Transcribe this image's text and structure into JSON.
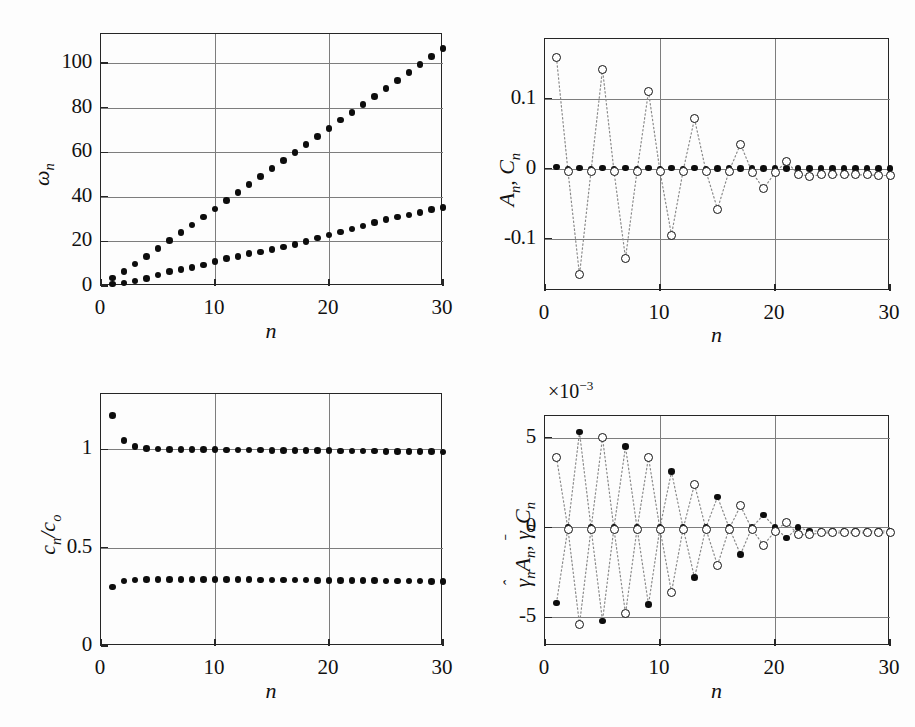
{
  "figure": {
    "panel_count": 4,
    "background": "#ffffff",
    "marker_filled_color": "#0d0d0d",
    "marker_open_color": "#111111",
    "gridline_color": "#7d7d7d",
    "axis_color": "#262626"
  },
  "panels": [
    {
      "id": "panel-omega",
      "position": "top-left",
      "xlabel": "n",
      "ylabel": "ωn",
      "ylabel_parts": {
        "symbol": "ω",
        "subscript": "n"
      },
      "xticks": [
        "0",
        "10",
        "20",
        "30"
      ],
      "yticks": [
        "0",
        "20",
        "40",
        "60",
        "80",
        "100"
      ],
      "xlim": [
        0,
        30
      ],
      "ylim": [
        0,
        113
      ],
      "exponent": ""
    },
    {
      "id": "panel-AnCn",
      "position": "top-right",
      "xlabel": "n",
      "ylabel": "An, Cn",
      "xticks": [
        "0",
        "10",
        "20",
        "30"
      ],
      "yticks": [
        "-0.1",
        "0",
        "0.1"
      ],
      "xlim": [
        0,
        30
      ],
      "ylim": [
        -0.175,
        0.185
      ],
      "exponent": ""
    },
    {
      "id": "panel-cnco",
      "position": "bottom-left",
      "xlabel": "n",
      "ylabel": "cn/co",
      "xticks": [
        "0",
        "10",
        "20",
        "30"
      ],
      "yticks": [
        "0",
        "0.5",
        "1"
      ],
      "xlim": [
        0,
        30
      ],
      "ylim": [
        0,
        1.28
      ],
      "exponent": ""
    },
    {
      "id": "panel-gammaAC",
      "position": "bottom-right",
      "xlabel": "n",
      "ylabel": "γ̂n An, γ̄n Cn",
      "xticks": [
        "0",
        "10",
        "20",
        "30"
      ],
      "yticks": [
        "-5",
        "0",
        "5"
      ],
      "xlim": [
        0,
        30
      ],
      "ylim": [
        -6.6,
        6.2
      ],
      "exponent": "×10⁻³"
    }
  ],
  "chart_data": [
    {
      "type": "scatter",
      "id": "panel-omega",
      "title": "",
      "xlabel": "n",
      "ylabel": "ωn",
      "xlim": [
        0,
        30
      ],
      "ylim": [
        0,
        113
      ],
      "grid": true,
      "legend": "none",
      "x": [
        1,
        2,
        3,
        4,
        5,
        6,
        7,
        8,
        9,
        10,
        11,
        12,
        13,
        14,
        15,
        16,
        17,
        18,
        19,
        20,
        21,
        22,
        23,
        24,
        25,
        26,
        27,
        28,
        29,
        30
      ],
      "series": [
        {
          "name": "branch-upper",
          "marker": "filled-circle",
          "values": [
            3.5,
            6.6,
            9.8,
            13.3,
            16.8,
            20.3,
            23.9,
            27.4,
            31.0,
            34.6,
            38.3,
            41.8,
            45.4,
            49.0,
            52.6,
            56.2,
            59.8,
            63.4,
            67.0,
            70.7,
            74.4,
            77.9,
            81.4,
            85.1,
            88.6,
            92.2,
            95.8,
            99.4,
            102.8,
            106.4
          ]
        },
        {
          "name": "branch-lower",
          "marker": "filled-circle",
          "values": [
            0.9,
            1.4,
            2.3,
            3.4,
            4.9,
            6.4,
            7.4,
            8.4,
            9.5,
            11.1,
            12.4,
            13.3,
            14.5,
            15.3,
            16.3,
            17.4,
            18.6,
            20.0,
            21.5,
            22.9,
            24.3,
            25.5,
            26.9,
            28.4,
            29.7,
            30.9,
            31.9,
            33.0,
            34.2,
            35.2
          ]
        }
      ]
    },
    {
      "type": "scatter",
      "id": "panel-AnCn",
      "title": "",
      "xlabel": "n",
      "ylabel": "An, Cn",
      "xlim": [
        0,
        30
      ],
      "ylim": [
        -0.175,
        0.185
      ],
      "grid": true,
      "legend": "none",
      "x": [
        1,
        2,
        3,
        4,
        5,
        6,
        7,
        8,
        9,
        10,
        11,
        12,
        13,
        14,
        15,
        16,
        17,
        18,
        19,
        20,
        21,
        22,
        23,
        24,
        25,
        26,
        27,
        28,
        29,
        30
      ],
      "series": [
        {
          "name": "An",
          "marker": "filled-circle",
          "connect": false,
          "values": [
            0.002,
            -0.0015,
            0.001,
            -0.001,
            0.0008,
            -0.0008,
            0.0007,
            -0.0007,
            0.0006,
            -0.0006,
            0.0005,
            -0.0005,
            0.0005,
            -0.0005,
            0.0004,
            -0.0004,
            0.0004,
            -0.0004,
            0.0003,
            -0.0003,
            0.0003,
            -0.0003,
            0.0003,
            -0.0003,
            0.0002,
            -0.0002,
            0.0002,
            -0.0002,
            0.0002,
            -0.0002
          ]
        },
        {
          "name": "Cn",
          "marker": "open-circle",
          "connect": true,
          "values": [
            0.158,
            -0.004,
            -0.152,
            -0.004,
            0.142,
            -0.004,
            -0.128,
            -0.004,
            0.11,
            -0.004,
            -0.095,
            -0.004,
            0.071,
            -0.004,
            -0.058,
            -0.004,
            0.035,
            -0.005,
            -0.029,
            -0.006,
            0.01,
            -0.008,
            -0.011,
            -0.009,
            -0.009,
            -0.009,
            -0.009,
            -0.009,
            -0.01,
            -0.01
          ]
        }
      ]
    },
    {
      "type": "scatter",
      "id": "panel-cnco",
      "title": "",
      "xlabel": "n",
      "ylabel": "cn/co",
      "xlim": [
        0,
        30
      ],
      "ylim": [
        0,
        1.28
      ],
      "grid": true,
      "legend": "none",
      "x": [
        1,
        2,
        3,
        4,
        5,
        6,
        7,
        8,
        9,
        10,
        11,
        12,
        13,
        14,
        15,
        16,
        17,
        18,
        19,
        20,
        21,
        22,
        23,
        24,
        25,
        26,
        27,
        28,
        29,
        30
      ],
      "series": [
        {
          "name": "cn-upper",
          "marker": "filled-circle",
          "values": [
            1.17,
            1.045,
            1.012,
            1.004,
            1.0,
            0.999,
            0.998,
            0.998,
            0.997,
            0.997,
            0.996,
            0.996,
            0.995,
            0.995,
            0.994,
            0.994,
            0.993,
            0.993,
            0.992,
            0.992,
            0.991,
            0.991,
            0.99,
            0.99,
            0.989,
            0.989,
            0.988,
            0.988,
            0.987,
            0.986
          ]
        },
        {
          "name": "cn-lower",
          "marker": "filled-circle",
          "values": [
            0.299,
            0.331,
            0.336,
            0.338,
            0.338,
            0.338,
            0.338,
            0.338,
            0.338,
            0.337,
            0.337,
            0.337,
            0.337,
            0.336,
            0.336,
            0.336,
            0.335,
            0.335,
            0.334,
            0.334,
            0.333,
            0.333,
            0.332,
            0.332,
            0.331,
            0.331,
            0.33,
            0.33,
            0.329,
            0.328
          ]
        }
      ]
    },
    {
      "type": "scatter",
      "id": "panel-gammaAC",
      "title": "",
      "xlabel": "n",
      "ylabel": "γ̂n An, γ̄n Cn",
      "xlim": [
        0,
        30
      ],
      "ylim": [
        -6.6,
        6.2
      ],
      "scale_factor": "×10⁻³",
      "grid": true,
      "legend": "none",
      "x": [
        1,
        2,
        3,
        4,
        5,
        6,
        7,
        8,
        9,
        10,
        11,
        12,
        13,
        14,
        15,
        16,
        17,
        18,
        19,
        20,
        21,
        22,
        23,
        24,
        25,
        26,
        27,
        28,
        29,
        30
      ],
      "series": [
        {
          "name": "gammahat-An",
          "marker": "filled-circle",
          "connect": true,
          "values": [
            -4.2,
            0.0,
            5.3,
            0.0,
            -5.2,
            0.0,
            4.5,
            0.0,
            -4.3,
            0.0,
            3.1,
            0.0,
            -2.8,
            0.0,
            1.7,
            0.0,
            -1.5,
            0.0,
            0.7,
            0.0,
            -0.6,
            0.0,
            -0.2,
            -0.2,
            -0.2,
            -0.2,
            -0.2,
            -0.2,
            -0.2,
            -0.2
          ]
        },
        {
          "name": "gammabar-Cn",
          "marker": "open-circle",
          "connect": true,
          "values": [
            3.9,
            -0.1,
            -5.4,
            -0.1,
            5.0,
            -0.1,
            -4.8,
            -0.1,
            3.9,
            -0.1,
            -3.6,
            -0.1,
            2.4,
            -0.1,
            -2.1,
            -0.1,
            1.2,
            -0.1,
            -1.0,
            -0.2,
            0.3,
            -0.4,
            -0.4,
            -0.3,
            -0.3,
            -0.3,
            -0.3,
            -0.3,
            -0.3,
            -0.3
          ]
        }
      ]
    }
  ]
}
